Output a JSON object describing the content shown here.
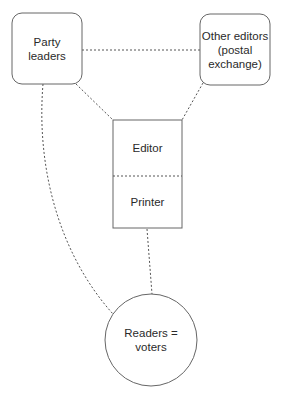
{
  "diagram": {
    "nodes": {
      "party_leaders": {
        "shape": "rounded-rect",
        "lines": [
          "Party",
          "leaders"
        ]
      },
      "other_editors": {
        "shape": "rounded-rect",
        "lines": [
          "Other editors",
          "(postal",
          "exchange)"
        ]
      },
      "editor": {
        "shape": "rect-top",
        "lines": [
          "Editor"
        ]
      },
      "printer": {
        "shape": "rect-bottom",
        "lines": [
          "Printer"
        ]
      },
      "readers": {
        "shape": "circle",
        "lines": [
          "Readers =",
          "voters"
        ]
      }
    },
    "edges": [
      {
        "from": "party_leaders",
        "to": "other_editors",
        "style": "dashed"
      },
      {
        "from": "party_leaders",
        "to": "editor",
        "style": "dashed"
      },
      {
        "from": "other_editors",
        "to": "editor",
        "style": "dashed"
      },
      {
        "from": "printer",
        "to": "readers",
        "style": "dashed"
      },
      {
        "from": "party_leaders",
        "to": "readers",
        "style": "dashed-curve"
      }
    ],
    "colors": {
      "stroke": "#666666",
      "text": "#2a2a2a",
      "background": "#ffffff"
    }
  }
}
